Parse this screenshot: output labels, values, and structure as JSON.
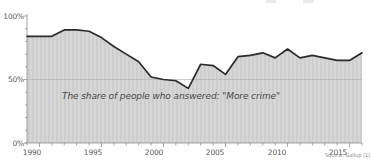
{
  "chart_data": {
    "type": "area",
    "title": "",
    "subtitle": "",
    "xlabel": "",
    "ylabel": "",
    "annotation": "The share of people who answered: \"More crime\"",
    "source": "Source: Gallup (1)",
    "grid": true,
    "legend_position": "none",
    "xlim": [
      1989,
      1616.5
    ],
    "ylim": [
      0,
      100
    ],
    "y_ticks": [
      0,
      50,
      100
    ],
    "y_tick_labels": [
      "0%",
      "50%",
      "100%"
    ],
    "x_ticks": [
      1990,
      1995,
      2000,
      2005,
      2010,
      2015
    ],
    "x_tick_labels": [
      "1990",
      "1995",
      "2000",
      "2005",
      "2010",
      "2015"
    ],
    "x": [
      1989,
      1990,
      1991,
      1992,
      1993,
      1994,
      1995,
      1996,
      1997,
      1998,
      1999,
      2000,
      2001,
      2002,
      2003,
      2004,
      2005,
      2006,
      2007,
      2008,
      2009,
      2010,
      2011,
      2012,
      2013,
      2014,
      2015,
      2016
    ],
    "values": [
      84,
      84,
      84,
      89,
      89,
      88,
      83,
      76,
      70,
      64,
      52,
      50,
      49,
      43,
      62,
      61,
      54,
      68,
      69,
      71,
      67,
      74,
      67,
      69,
      67,
      65,
      65,
      71
    ],
    "series": [
      {
        "name": "More crime",
        "values": [
          84,
          84,
          84,
          89,
          89,
          88,
          83,
          76,
          70,
          64,
          52,
          50,
          49,
          43,
          62,
          61,
          54,
          68,
          69,
          71,
          67,
          74,
          67,
          69,
          67,
          65,
          65,
          71
        ]
      }
    ],
    "line_color": "#2b2b2b",
    "area_color": "#d6d6d6",
    "grid_color": "#b4b4b4",
    "axis_color": "#8d8d8d",
    "text_color": "#5a5a5a"
  },
  "axes": {
    "y_labels": [
      {
        "text": "100%",
        "top": 12,
        "right": 350
      },
      {
        "text": "50%",
        "top": 75,
        "right": 350
      },
      {
        "text": "0%",
        "top": 139,
        "right": 350
      }
    ],
    "x_labels": [
      {
        "text": "1990",
        "left": 32
      },
      {
        "text": "1995",
        "left": 93
      },
      {
        "text": "2000",
        "left": 154
      },
      {
        "text": "2005",
        "left": 215
      },
      {
        "text": "2010",
        "left": 277
      },
      {
        "text": "2015",
        "left": 338
      }
    ]
  }
}
